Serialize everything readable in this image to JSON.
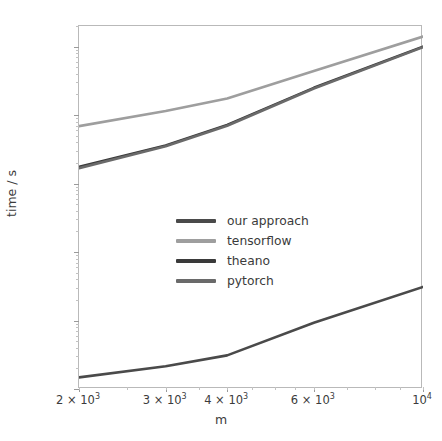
{
  "chart_data": {
    "type": "line",
    "title": "",
    "xlabel": "m",
    "ylabel": "time / s",
    "xscale": "log",
    "yscale": "log",
    "xlim": [
      2000,
      10000
    ],
    "ylim": [
      0.0001,
      20
    ],
    "grid": false,
    "legend_position": "center-left",
    "x": [
      2000,
      3000,
      4000,
      6000,
      10000
    ],
    "xtick_labels": [
      "2 × 10³",
      "3 × 10³",
      "4 × 10³",
      "6 × 10³",
      "10⁴"
    ],
    "xtick_bases": [
      "2 × 10",
      "3 × 10",
      "4 × 10",
      "6 × 10",
      "10"
    ],
    "xtick_exps": [
      "3",
      "3",
      "3",
      "3",
      "4"
    ],
    "ytick_labels": [
      "10¹",
      "10⁰",
      "10⁻¹",
      "10⁻²",
      "10⁻³",
      "10⁻⁴"
    ],
    "ytick_values": [
      10,
      1,
      0.1,
      0.01,
      0.001,
      0.0001
    ],
    "series": [
      {
        "name": "our approach",
        "color": "#4a4a4a",
        "values": [
          0.000148,
          0.000215,
          0.00031,
          0.00093,
          0.0031
        ]
      },
      {
        "name": "tensorflow",
        "color": "#9e9e9e",
        "values": [
          0.69,
          1.15,
          1.75,
          4.4,
          14.0
        ]
      },
      {
        "name": "theano",
        "color": "#3a3a3a",
        "values": [
          0.175,
          0.36,
          0.72,
          2.5,
          10.0
        ]
      },
      {
        "name": "pytorch",
        "color": "#6a6a6a",
        "values": [
          0.168,
          0.35,
          0.7,
          2.45,
          9.8
        ]
      }
    ]
  },
  "axes": {
    "frame_color": "#b9b9b9",
    "tick_color": "#9a9a9a",
    "text_color": "#3b3b3b",
    "background": "#ffffff"
  }
}
